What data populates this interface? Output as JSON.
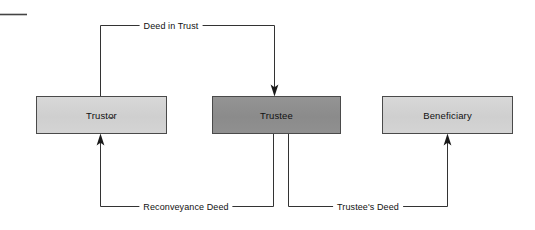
{
  "diagram": {
    "background_color": "#ffffff",
    "line_color": "#333333",
    "nodes": [
      {
        "id": "trustor",
        "label": "Trustor",
        "fill": "#d2d2d2",
        "border": "#4a4a4a",
        "style": "light",
        "x": 36,
        "y": 96,
        "width": 131,
        "height": 38,
        "extra_mark": "-"
      },
      {
        "id": "trustee",
        "label": "Trustee",
        "fill": "#8f8f8f",
        "border": "#4a4a4a",
        "style": "dark",
        "x": 212,
        "y": 96,
        "width": 129,
        "height": 38
      },
      {
        "id": "beneficiary",
        "label": "Beneficiary",
        "fill": "#d2d2d2",
        "border": "#4a4a4a",
        "style": "light",
        "x": 382,
        "y": 96,
        "width": 131,
        "height": 38
      }
    ],
    "edges": [
      {
        "id": "deed-in-trust",
        "label": "Deed in Trust",
        "from": "trustor",
        "to": "trustee",
        "direction": "trustor-to-trustee",
        "label_x": 171,
        "label_y": 26,
        "arrowhead": "down-into-trustee-top"
      },
      {
        "id": "reconveyance-deed",
        "label": "Reconveyance Deed",
        "from": "trustee",
        "to": "trustor",
        "direction": "trustee-to-trustor",
        "label_x": 186,
        "label_y": 207,
        "arrowhead": "up-into-trustor-bottom"
      },
      {
        "id": "trustees-deed",
        "label": "Trustee's Deed",
        "from": "trustee",
        "to": "beneficiary",
        "direction": "trustee-to-beneficiary",
        "label_x": 368,
        "label_y": 207,
        "arrowhead": "up-into-beneficiary-bottom"
      }
    ],
    "margin_rule": {
      "id": "top-left-rule",
      "x1": 0,
      "y1": 14,
      "x2": 27,
      "y2": 14
    }
  }
}
